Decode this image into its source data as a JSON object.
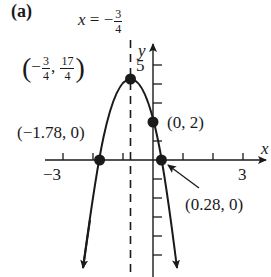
{
  "figure": {
    "part_label": "(a)",
    "axis_of_symmetry": {
      "lhs": "x",
      "eq": "=",
      "sign": "−",
      "num": "3",
      "den": "4",
      "x_value": -0.75
    },
    "axes": {
      "x_label": "x",
      "y_label": "y",
      "x_tick_labels": [
        "−3",
        "3"
      ],
      "y_tick_labels": [
        "5"
      ],
      "x_range": [
        -3.5,
        3.5
      ],
      "y_range": [
        -6,
        5.5
      ]
    },
    "vertex": {
      "x": -0.75,
      "y": 4.25,
      "x_sign": "−",
      "x_num": "3",
      "x_den": "4",
      "y_num": "17",
      "y_den": "4",
      "comma": ","
    },
    "points": [
      {
        "name": "y-intercept",
        "x": 0,
        "y": 2,
        "label": "(0, 2)"
      },
      {
        "name": "left-x-intercept",
        "x": -1.78,
        "y": 0,
        "label": "(−1.78, 0)"
      },
      {
        "name": "right-x-intercept",
        "x": 0.28,
        "y": 0,
        "label": "(0.28, 0)"
      }
    ],
    "curve": {
      "equation": "y = -2x^2 - 3x + 2",
      "type": "parabola opening downward"
    },
    "colors": {
      "ink": "#1a1a1a",
      "background": "#ffffff"
    }
  }
}
